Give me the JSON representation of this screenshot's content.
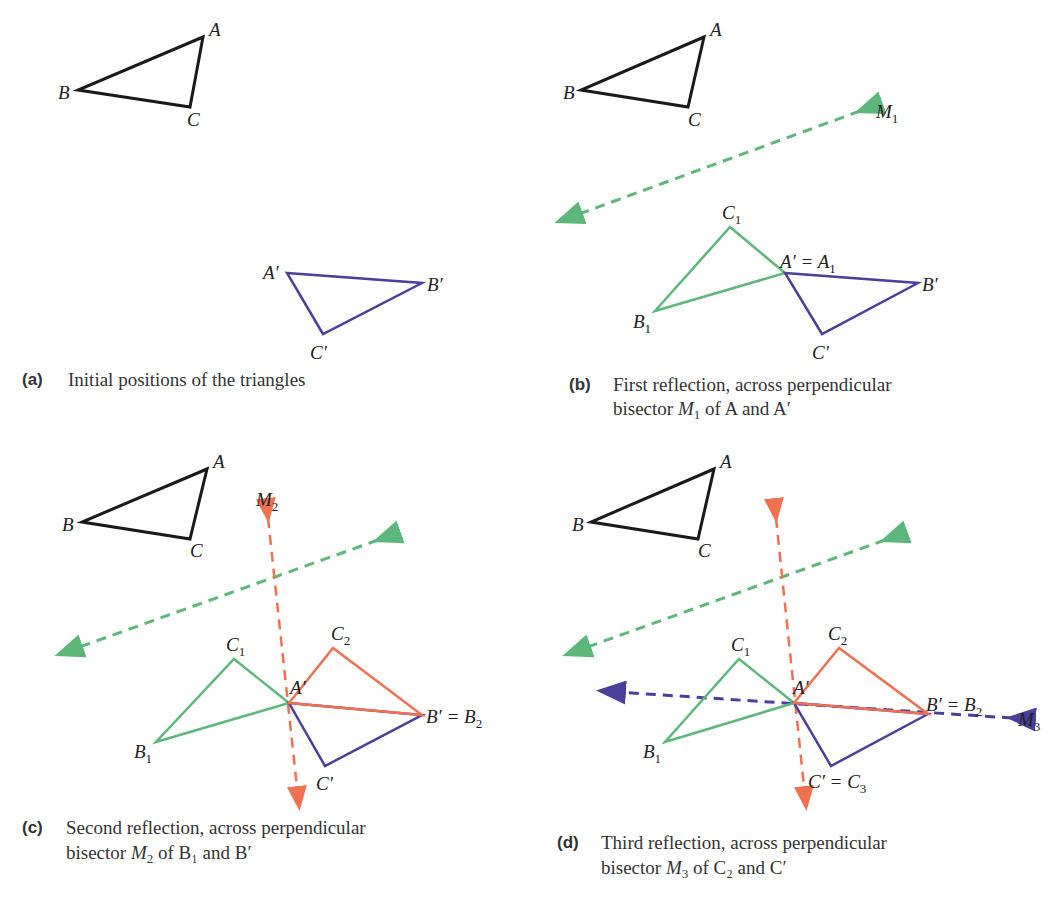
{
  "colors": {
    "original": "#1a1a1a",
    "target": "#4b3f9c",
    "first_reflection": "#5cb87a",
    "second_reflection": "#f07050",
    "third_mirror": "#4b3f9c"
  },
  "panels": [
    {
      "tag": "(a)",
      "caption_line1": "Initial positions of the triangles",
      "caption_line2": "",
      "labels": {
        "A": "A",
        "B": "B",
        "C": "C",
        "Ap": "A′",
        "Bp": "B′",
        "Cp": "C′"
      }
    },
    {
      "tag": "(b)",
      "caption_line1": "First reflection, across perpendicular",
      "caption_line2_pre": "bisector ",
      "caption_line2_m": "M",
      "caption_line2_sub": "1",
      "caption_line2_post": " of A and A′",
      "labels": {
        "A": "A",
        "B": "B",
        "C": "C",
        "M1": "M",
        "M1_sub": "1",
        "C1": "C",
        "C1_sub": "1",
        "A1": "A′ = A",
        "A1_sub": "1",
        "B1": "B",
        "B1_sub": "1",
        "Bp": "B′",
        "Cp": "C′"
      }
    },
    {
      "tag": "(c)",
      "caption_line1": "Second reflection, across perpendicular",
      "caption_line2_pre": "bisector ",
      "caption_line2_m": "M",
      "caption_line2_sub": "2",
      "caption_line2_post": " of B₁ and B′",
      "labels": {
        "A": "A",
        "B": "B",
        "C": "C",
        "M2": "M",
        "M2_sub": "2",
        "C1": "C",
        "C1_sub": "1",
        "C2": "C",
        "C2_sub": "2",
        "Ap": "A′",
        "B2": "B′ = B",
        "B2_sub": "2",
        "B1": "B",
        "B1_sub": "1",
        "Cp": "C′"
      }
    },
    {
      "tag": "(d)",
      "caption_line1": "Third reflection, across perpendicular",
      "caption_line2_pre": "bisector ",
      "caption_line2_m": "M",
      "caption_line2_sub": "3",
      "caption_line2_post": " of C₂ and C′",
      "labels": {
        "A": "A",
        "B": "B",
        "C": "C",
        "M3": "M",
        "M3_sub": "3",
        "C1": "C",
        "C1_sub": "1",
        "C2": "C",
        "C2_sub": "2",
        "Ap": "A′",
        "B2": "B′ = B",
        "B2_sub": "2",
        "B1": "B",
        "B1_sub": "1",
        "C3": "C′ = C",
        "C3_sub": "3"
      }
    }
  ]
}
